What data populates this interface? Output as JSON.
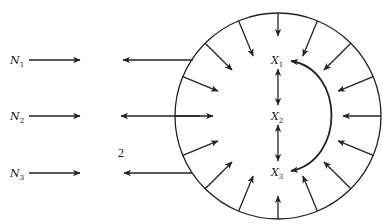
{
  "diagram": {
    "colors": {
      "stroke": "#222222",
      "background": "#ffffff"
    },
    "left_labels": [
      {
        "main": "N",
        "sub": "1",
        "y": 60
      },
      {
        "main": "N",
        "sub": "2",
        "y": 116
      },
      {
        "main": "N",
        "sub": "3",
        "y": 173
      }
    ],
    "region_label": "2",
    "inner_labels": [
      {
        "main": "X",
        "sub": "1",
        "y": 61
      },
      {
        "main": "X",
        "sub": "2",
        "y": 116
      },
      {
        "main": "X",
        "sub": "3",
        "y": 172
      }
    ],
    "circle": {
      "cx": 278,
      "cy": 116,
      "r": 103
    },
    "radial_arrow_count": 16
  }
}
